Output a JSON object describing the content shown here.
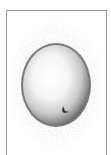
{
  "figure": {
    "colors": {
      "background": "#ffffff",
      "frame": "#9a9a9a",
      "halo": "#8a8a8a",
      "rim": "#6e6e6e",
      "center": "#ffffff",
      "nucleus": "#333333"
    }
  }
}
